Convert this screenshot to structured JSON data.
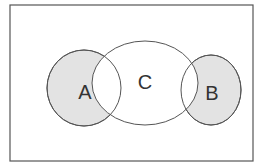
{
  "diagram": {
    "type": "venn",
    "universe": {
      "x": 10,
      "y": 5,
      "width": 243,
      "height": 156,
      "stroke": "#555555",
      "fill": "#ffffff"
    },
    "sets": [
      {
        "id": "A",
        "label": "A",
        "cx": 84,
        "cy": 88,
        "rx": 37,
        "ry": 38,
        "fill": "#e3e3e3",
        "shaded": true,
        "label_x": 85,
        "label_y": 99
      },
      {
        "id": "B",
        "label": "B",
        "cx": 211,
        "cy": 90,
        "rx": 30,
        "ry": 35,
        "fill": "#e3e3e3",
        "shaded": true,
        "label_x": 212,
        "label_y": 100
      },
      {
        "id": "C",
        "label": "C",
        "cx": 145,
        "cy": 83,
        "rx": 53,
        "ry": 42,
        "fill": "#ffffff",
        "shaded": false,
        "label_x": 145,
        "label_y": 89
      }
    ],
    "stroke_color": "#555555",
    "shade_color": "#e3e3e3"
  }
}
